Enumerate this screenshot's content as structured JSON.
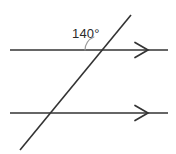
{
  "figure": {
    "background_color": "#ffffff",
    "line_color": "#333333",
    "arc_color": "#9a9a9a",
    "text_color": "#2b2b2b",
    "line_width": 1.6,
    "arc_width": 1.0
  },
  "labels": {
    "angle_value": "140°"
  },
  "geometry": {
    "upper_parallel_line": {
      "name": "upper-parallel-line",
      "x1": 10,
      "y1": 50,
      "x2": 168,
      "y2": 50,
      "arrow": "right"
    },
    "lower_parallel_line": {
      "name": "lower-parallel-line",
      "x1": 10,
      "y1": 113,
      "x2": 168,
      "y2": 113,
      "arrow": "right"
    },
    "transversal_line": {
      "name": "transversal-line",
      "x1": 20,
      "y1": 150,
      "x2": 131,
      "y2": 15,
      "arrow": "none"
    },
    "upper_intersection": {
      "x": 99,
      "y": 50
    },
    "lower_intersection": {
      "x": 46,
      "y": 113
    },
    "angle_arc": {
      "center_x": 99,
      "center_y": 50,
      "radius": 14,
      "start_angle_deg": 180,
      "end_angle_deg": 50.6
    },
    "angle_label_position": {
      "x": 72,
      "y": 38
    }
  }
}
